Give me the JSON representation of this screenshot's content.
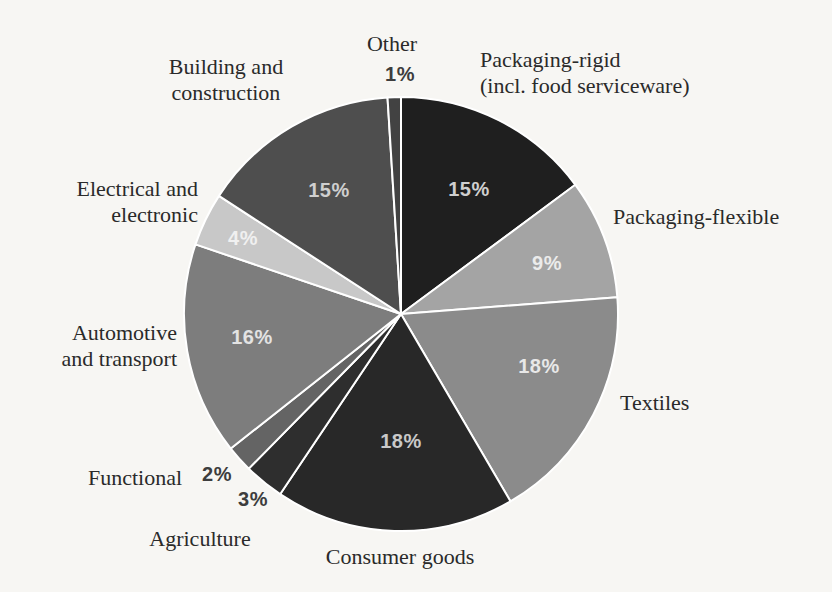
{
  "page": {
    "background_color": "#f7f6f3",
    "figure_kind": "scanned pie chart figure"
  },
  "chart_data": {
    "type": "pie",
    "title": "",
    "unit": "%",
    "direction": "clockwise",
    "start_angle_deg": 0,
    "legend": "none (direct callout labels)",
    "center": [
      401,
      314
    ],
    "radius": 217,
    "slice_border_color": "#ffffff",
    "categories": [
      "Packaging-rigid (incl. food serviceware)",
      "Packaging-flexible",
      "Textiles",
      "Consumer goods",
      "Agriculture",
      "Functional",
      "Automotive and transport",
      "Electrical and electronic",
      "Building and construction",
      "Other"
    ],
    "values": [
      15,
      9,
      18,
      18,
      3,
      2,
      16,
      4,
      15,
      1
    ],
    "slices": [
      {
        "name": "Packaging-rigid (incl. food serviceware)",
        "value": 15,
        "pct_label": "15%",
        "color": "#1f1f1f",
        "pct_label_color": "#cfcfcf",
        "pct_label_pos": [
          469,
          189
        ],
        "name_lines": [
          "Packaging-rigid",
          "(incl. food serviceware)"
        ],
        "name_pos": [
          480,
          73
        ],
        "name_align": "left"
      },
      {
        "name": "Packaging-flexible",
        "value": 9,
        "pct_label": "9%",
        "color": "#a4a4a4",
        "pct_label_color": "#ebebeb",
        "pct_label_pos": [
          547,
          263
        ],
        "name_lines": [
          "Packaging-flexible"
        ],
        "name_pos": [
          613,
          217
        ],
        "name_align": "left"
      },
      {
        "name": "Textiles",
        "value": 18,
        "pct_label": "18%",
        "color": "#8b8b8b",
        "pct_label_color": "#e8e8e8",
        "pct_label_pos": [
          539,
          366
        ],
        "name_lines": [
          "Textiles"
        ],
        "name_pos": [
          620,
          403
        ],
        "name_align": "left"
      },
      {
        "name": "Consumer goods",
        "value": 18,
        "pct_label": "18%",
        "color": "#282828",
        "pct_label_color": "#c9c9c9",
        "pct_label_pos": [
          401,
          441
        ],
        "name_lines": [
          "Consumer goods"
        ],
        "name_pos": [
          400,
          557
        ],
        "name_align": "center"
      },
      {
        "name": "Agriculture",
        "value": 3,
        "pct_label": "3%",
        "color": "#2e2e2e",
        "pct_label_color": "#3d3d3d",
        "pct_label_pos": [
          253,
          499
        ],
        "name_lines": [
          "Agriculture"
        ],
        "name_pos": [
          200,
          539
        ],
        "name_align": "center"
      },
      {
        "name": "Functional",
        "value": 2,
        "pct_label": "2%",
        "color": "#646464",
        "pct_label_color": "#3d3d3d",
        "pct_label_pos": [
          217,
          474
        ],
        "name_lines": [
          "Functional"
        ],
        "name_pos": [
          135,
          478
        ],
        "name_align": "center"
      },
      {
        "name": "Automotive and transport",
        "value": 16,
        "pct_label": "16%",
        "color": "#7d7d7d",
        "pct_label_color": "#e3e3e3",
        "pct_label_pos": [
          252,
          337
        ],
        "name_lines": [
          "Automotive",
          "and transport"
        ],
        "name_pos": [
          177,
          346
        ],
        "name_align": "right"
      },
      {
        "name": "Electrical and electronic",
        "value": 4,
        "pct_label": "4%",
        "color": "#c8c8c8",
        "pct_label_color": "#f0f0f0",
        "pct_label_pos": [
          243,
          238
        ],
        "name_lines": [
          "Electrical and",
          "electronic"
        ],
        "name_pos": [
          198,
          202
        ],
        "name_align": "right"
      },
      {
        "name": "Building and construction",
        "value": 15,
        "pct_label": "15%",
        "color": "#4e4e4e",
        "pct_label_color": "#cfcfcf",
        "pct_label_pos": [
          329,
          190
        ],
        "name_lines": [
          "Building and",
          "construction"
        ],
        "name_pos": [
          226,
          80
        ],
        "name_align": "center"
      },
      {
        "name": "Other",
        "value": 1,
        "pct_label": "1%",
        "color": "#424242",
        "pct_label_color": "#3d3d3d",
        "pct_label_pos": [
          400,
          74
        ],
        "name_lines": [
          "Other"
        ],
        "name_pos": [
          392,
          44
        ],
        "name_align": "center"
      }
    ]
  }
}
